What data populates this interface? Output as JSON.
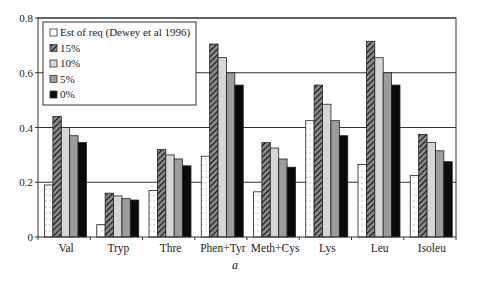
{
  "chart_data": {
    "type": "bar",
    "title": "",
    "xlabel": "",
    "ylabel": "",
    "ylim": [
      0,
      0.8
    ],
    "yticks": [
      0,
      0.2,
      0.4,
      0.6,
      0.8
    ],
    "ytick_labels": [
      "0",
      "0.2",
      "0.4",
      "0.6",
      "0.8"
    ],
    "grid": "horizontal",
    "legend_position": "upper-left, inside",
    "categories": [
      "Val",
      "Tryp",
      "Thre",
      "Phen+Tyr",
      "Meth+Cys",
      "Lys",
      "Leu",
      "Isoleu"
    ],
    "series": [
      {
        "name": "Est of req (Dewey et al 1996)",
        "pattern": "dotted-white",
        "values": [
          0.19,
          0.045,
          0.17,
          0.295,
          0.165,
          0.425,
          0.265,
          0.225
        ]
      },
      {
        "name": "15%",
        "pattern": "hatched",
        "values": [
          0.44,
          0.16,
          0.32,
          0.705,
          0.345,
          0.555,
          0.715,
          0.375
        ]
      },
      {
        "name": "10%",
        "pattern": "light-gray",
        "values": [
          0.4,
          0.15,
          0.3,
          0.655,
          0.325,
          0.485,
          0.655,
          0.345
        ]
      },
      {
        "name": "5%",
        "pattern": "mid-gray",
        "values": [
          0.37,
          0.14,
          0.285,
          0.6,
          0.285,
          0.425,
          0.6,
          0.315
        ]
      },
      {
        "name": "0%",
        "pattern": "black",
        "values": [
          0.345,
          0.135,
          0.26,
          0.555,
          0.255,
          0.37,
          0.555,
          0.275
        ]
      }
    ],
    "colors": {
      "est": "#ffffff",
      "p15": "#8a8a8a",
      "p10": "#d6d6d6",
      "p5": "#9c9c9c",
      "p0": "#0a0a0a",
      "grid": "#333333"
    },
    "caption": "a"
  }
}
